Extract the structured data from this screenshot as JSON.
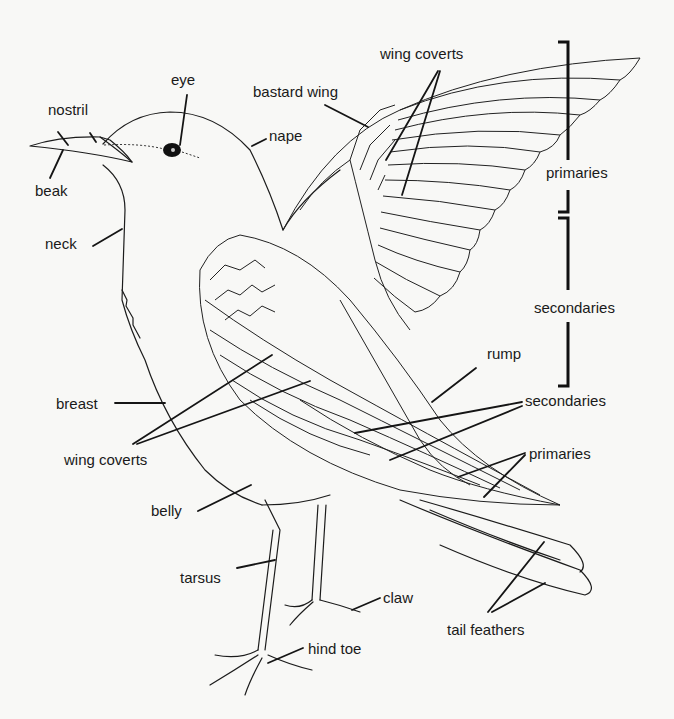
{
  "diagram": {
    "colors": {
      "ink": "#1a1a1a",
      "paper": "#f8f8f6"
    },
    "labels": {
      "eye": "eye",
      "nostril": "nostril",
      "beak": "beak",
      "nape": "nape",
      "bastard_wing": "bastard wing",
      "wing_coverts_top": "wing coverts",
      "primaries_bracket": "primaries",
      "secondaries_bracket": "secondaries",
      "neck": "neck",
      "rump": "rump",
      "breast": "breast",
      "wing_coverts_body": "wing coverts",
      "secondaries_body": "secondaries",
      "primaries_body": "primaries",
      "belly": "belly",
      "tarsus": "tarsus",
      "claw": "claw",
      "tail_feathers": "tail feathers",
      "hind_toe": "hind toe"
    }
  }
}
